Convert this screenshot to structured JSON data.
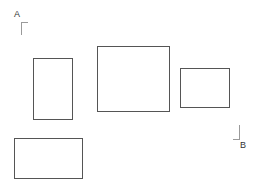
{
  "diagram": {
    "type": "region-selection",
    "background": "#ffffff",
    "stroke_color": "#555555",
    "corners": {
      "start": {
        "label": "A",
        "x": 21,
        "y": 22
      },
      "end": {
        "label": "B",
        "x": 239,
        "y": 139
      }
    },
    "rectangles": [
      {
        "id": "rect-1",
        "x": 33,
        "y": 58,
        "width": 40,
        "height": 62
      },
      {
        "id": "rect-2",
        "x": 97,
        "y": 46,
        "width": 73,
        "height": 66
      },
      {
        "id": "rect-3",
        "x": 180,
        "y": 68,
        "width": 50,
        "height": 40
      },
      {
        "id": "rect-4",
        "x": 14,
        "y": 138,
        "width": 69,
        "height": 41
      }
    ]
  }
}
